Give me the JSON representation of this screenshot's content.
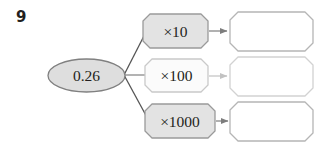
{
  "question": {
    "number": "9"
  },
  "diagram": {
    "type": "function-machine-flow",
    "start_node": {
      "shape": "ellipse",
      "value": "0.26",
      "fill": "#dedede",
      "stroke": "#808080"
    },
    "branches": [
      {
        "operation": "×10",
        "operation_fill": "#e3e3e3",
        "operation_stroke": "#9a9a9a",
        "arrow": "arrow-right",
        "answer": "",
        "answer_fill": "#ffffff",
        "answer_stroke": "#b5b5b5"
      },
      {
        "operation": "×100",
        "operation_fill": "#fbfbfb",
        "operation_stroke": "#c9c9c9",
        "arrow": "arrow-right",
        "answer": "",
        "answer_fill": "#ffffff",
        "answer_stroke": "#d2d2d2"
      },
      {
        "operation": "×1000",
        "operation_fill": "#e3e3e3",
        "operation_stroke": "#9a9a9a",
        "arrow": "arrow-right",
        "answer": "",
        "answer_fill": "#ffffff",
        "answer_stroke": "#b5b5b5"
      }
    ],
    "connector_color": "#555555"
  }
}
